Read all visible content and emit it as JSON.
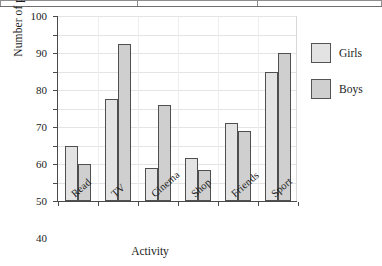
{
  "chart_data": {
    "type": "bar",
    "title": "",
    "xlabel": "Activity",
    "ylabel": "Number of people",
    "categories": [
      "Read",
      "TV",
      "Cinema",
      "Shop",
      "Friends",
      "Sport"
    ],
    "series": [
      {
        "name": "Girls",
        "color": "#e3e3e3",
        "values": [
          30,
          55,
          18,
          23,
          42,
          70
        ]
      },
      {
        "name": "Boys",
        "color": "#cfcfcf",
        "values": [
          20,
          85,
          52,
          17,
          38,
          80
        ]
      }
    ],
    "ylim": [
      0,
      100
    ],
    "ytick_labels": [
      "0",
      "10",
      "20",
      "30",
      "40",
      "50",
      "60",
      "70",
      "80",
      "90",
      "100"
    ],
    "ytick_values": [
      0,
      10,
      20,
      30,
      40,
      50,
      60,
      70,
      80,
      90,
      100
    ],
    "grid": true,
    "legend_position": "right",
    "xtick_rotation": -41
  },
  "legend": {
    "items": [
      {
        "label": "Girls"
      },
      {
        "label": "Boys"
      }
    ]
  },
  "axes": {
    "x_title": "Activity",
    "y_title": "Number of people"
  }
}
